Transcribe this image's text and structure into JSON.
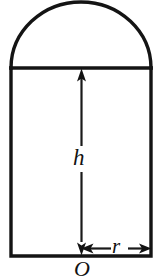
{
  "figure": {
    "background_color": "#ffffff",
    "outline_color": "#141414",
    "dimension_color": "#121212",
    "shape": {
      "type": "rectangle-with-semicircular-cap",
      "rect_left_x": 11,
      "rect_right_x": 151,
      "rect_top_y": 68,
      "rect_bottom_y": 256,
      "dome_apex_y": 3,
      "center_x": 81,
      "radius": 70,
      "height": 188
    }
  },
  "labels": {
    "height": "h",
    "radius": "r",
    "origin": "O"
  },
  "dimensions": [
    {
      "name": "height-dimension",
      "label": "h",
      "orientation": "vertical",
      "from_x": 81,
      "from_y": 256,
      "to_x": 81,
      "to_y": 68,
      "arrowheads": "both"
    },
    {
      "name": "radius-dimension",
      "label": "r",
      "orientation": "horizontal",
      "from_x": 81,
      "from_y": 249,
      "to_x": 151,
      "to_y": 249,
      "arrowheads": "both"
    }
  ]
}
